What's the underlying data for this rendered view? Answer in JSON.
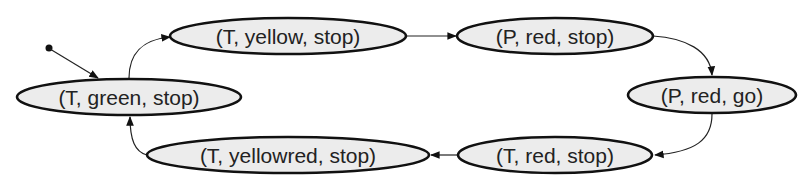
{
  "diagram": {
    "type": "state-machine",
    "initial_state": "(T, green, stop)",
    "nodes": [
      {
        "id": "tgs",
        "label": "(T, green, stop)"
      },
      {
        "id": "tys",
        "label": "(T, yellow, stop)"
      },
      {
        "id": "prs",
        "label": "(P, red, stop)"
      },
      {
        "id": "prg",
        "label": "(P, red, go)"
      },
      {
        "id": "trs",
        "label": "(T, red, stop)"
      },
      {
        "id": "tyrs",
        "label": "(T, yellowred, stop)"
      }
    ],
    "edges": [
      {
        "from": "initial",
        "to": "tgs"
      },
      {
        "from": "tgs",
        "to": "tys"
      },
      {
        "from": "tys",
        "to": "prs"
      },
      {
        "from": "prs",
        "to": "prg"
      },
      {
        "from": "prg",
        "to": "trs"
      },
      {
        "from": "trs",
        "to": "tyrs"
      },
      {
        "from": "tyrs",
        "to": "tgs"
      }
    ]
  }
}
